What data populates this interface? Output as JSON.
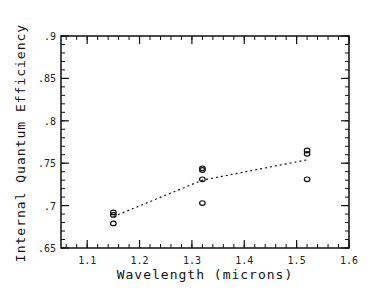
{
  "chart_data": {
    "type": "scatter",
    "title": "",
    "xlabel": "Wavelength (microns)",
    "ylabel": "Internal Quantum Efficiency",
    "xlim": [
      1.05,
      1.6
    ],
    "ylim": [
      0.65,
      0.9
    ],
    "x_ticks": [
      1.1,
      1.2,
      1.3,
      1.4,
      1.5,
      1.6
    ],
    "x_tick_labels": [
      "1.1",
      "1.2",
      "1.3",
      "1.4",
      "1.5",
      "1.6"
    ],
    "y_ticks": [
      0.65,
      0.7,
      0.75,
      0.8,
      0.85,
      0.9
    ],
    "y_tick_labels": [
      ".65",
      ".7",
      ".75",
      ".8",
      ".85",
      ".9"
    ],
    "grid": false,
    "legend": null,
    "series": [
      {
        "name": "measured",
        "marker": "open-circle",
        "points": [
          {
            "x": 1.15,
            "y": 0.692
          },
          {
            "x": 1.15,
            "y": 0.689
          },
          {
            "x": 1.15,
            "y": 0.679
          },
          {
            "x": 1.32,
            "y": 0.744
          },
          {
            "x": 1.32,
            "y": 0.742
          },
          {
            "x": 1.32,
            "y": 0.731
          },
          {
            "x": 1.32,
            "y": 0.703
          },
          {
            "x": 1.52,
            "y": 0.765
          },
          {
            "x": 1.52,
            "y": 0.761
          },
          {
            "x": 1.52,
            "y": 0.731
          }
        ]
      },
      {
        "name": "mean",
        "style": "dotted-line",
        "points": [
          {
            "x": 1.15,
            "y": 0.687
          },
          {
            "x": 1.32,
            "y": 0.73
          },
          {
            "x": 1.52,
            "y": 0.754
          }
        ]
      }
    ]
  }
}
